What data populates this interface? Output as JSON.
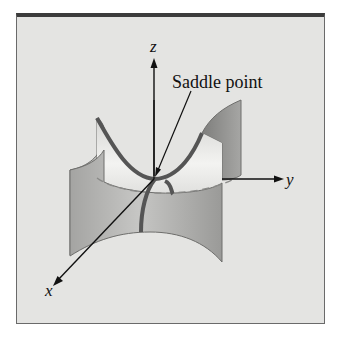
{
  "figure": {
    "annotation": "Saddle point",
    "axes": {
      "x": "x",
      "y": "y",
      "z": "z"
    },
    "colors": {
      "background": "#e4e4e2",
      "frame_top": "#3c3c3c",
      "frame_border": "#6a6a6a",
      "surface_light": "#f0f0ee",
      "surface_mid": "#b8b8b6",
      "surface_dark": "#8e8e8c",
      "curve": "#555555",
      "axis": "#111111"
    }
  }
}
